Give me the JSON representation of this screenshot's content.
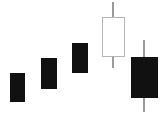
{
  "chart_data": {
    "type": "candlestick",
    "title": "",
    "subtitle": "",
    "xlabel": "",
    "ylabel": "",
    "grid": false,
    "legend": false,
    "axes_visible": false,
    "background_color": "#ffffff",
    "bearish_color": "#111111",
    "bullish_color": "#ffffff",
    "bullish_border_color": "#b5b5b5",
    "wick_color": "#9a9a9a",
    "pattern_name": "Evening Star / Bearish Engulfing",
    "categories": [
      "1",
      "2",
      "3",
      "4",
      "5"
    ],
    "price_axis": {
      "pixel_top": 2,
      "pixel_bottom": 113,
      "value_top": 100,
      "value_bottom": 0
    },
    "candles": [
      {
        "index": 1,
        "label": "1",
        "direction": "bearish",
        "fill": "filled",
        "open": 74,
        "high": 74,
        "low": 48,
        "close": 48,
        "has_upper_wick": false,
        "has_lower_wick": false,
        "px": {
          "left": 10,
          "right": 25,
          "body_top": 73,
          "body_bottom": 102,
          "wick_top": 73,
          "wick_bottom": 102,
          "center_x": 17
        }
      },
      {
        "index": 2,
        "label": "2",
        "direction": "bearish",
        "fill": "filled",
        "open": 87,
        "high": 87,
        "low": 59,
        "close": 59,
        "has_upper_wick": false,
        "has_lower_wick": false,
        "px": {
          "left": 41,
          "right": 57,
          "body_top": 58,
          "body_bottom": 89,
          "wick_top": 58,
          "wick_bottom": 89,
          "center_x": 49
        }
      },
      {
        "index": 3,
        "label": "3",
        "direction": "bearish",
        "fill": "filled",
        "open": 100,
        "high": 100,
        "low": 73,
        "close": 73,
        "has_upper_wick": false,
        "has_lower_wick": false,
        "px": {
          "left": 72,
          "right": 88,
          "body_top": 43,
          "body_bottom": 73,
          "wick_top": 43,
          "wick_bottom": 73,
          "center_x": 80
        }
      },
      {
        "index": 4,
        "label": "4",
        "direction": "bullish",
        "fill": "hollow",
        "open": 50,
        "high": 113,
        "low": 40,
        "close": 86,
        "has_upper_wick": true,
        "has_lower_wick": true,
        "px": {
          "left": 102,
          "right": 125,
          "body_top": 17,
          "body_bottom": 57,
          "wick_top": 2,
          "wick_bottom": 68,
          "center_x": 113
        }
      },
      {
        "index": 5,
        "label": "5",
        "direction": "bearish",
        "fill": "filled",
        "open": 86,
        "high": 101,
        "low": 1,
        "close": 14,
        "has_upper_wick": true,
        "has_lower_wick": true,
        "px": {
          "left": 131,
          "right": 158,
          "body_top": 57,
          "body_bottom": 98,
          "wick_top": 40,
          "wick_bottom": 112,
          "center_x": 144
        }
      }
    ]
  }
}
